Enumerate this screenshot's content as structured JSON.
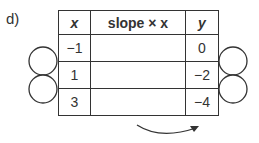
{
  "part_label": "d)",
  "table": {
    "headers": [
      "x",
      "slope × x",
      "y"
    ],
    "rows": [
      {
        "x": "−1",
        "slope_x": "",
        "y": "0"
      },
      {
        "x": "1",
        "slope_x": "",
        "y": "−2"
      },
      {
        "x": "3",
        "slope_x": "",
        "y": "−4"
      }
    ]
  }
}
